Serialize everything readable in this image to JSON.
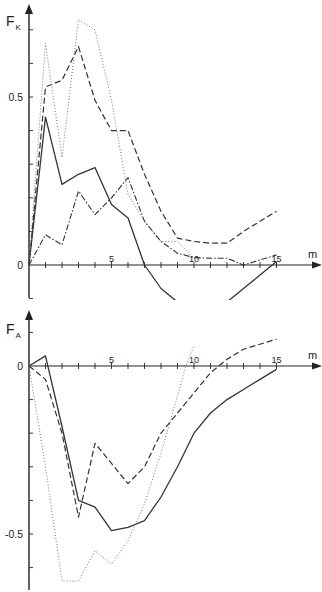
{
  "chart_data": [
    {
      "type": "line",
      "title": "",
      "ylabel": "F_K",
      "ylabel_main": "F",
      "ylabel_sub": "K",
      "xlabel": "m",
      "xlim": [
        0,
        17
      ],
      "ylim": [
        -0.2,
        0.75
      ],
      "x_ticks": [
        1,
        2,
        3,
        4,
        5,
        6,
        7,
        8,
        9,
        10,
        11,
        12,
        13,
        14,
        15
      ],
      "x_tick_labels": [
        {
          "value": 5,
          "label": "5"
        },
        {
          "value": 10,
          "label": "10"
        },
        {
          "value": 15,
          "label": "15"
        }
      ],
      "y_ticks": [
        -0.1,
        0.1,
        0.2,
        0.3,
        0.4,
        0.5,
        0.6,
        0.7
      ],
      "y_tick_labels": [
        {
          "value": 0,
          "label": "0"
        },
        {
          "value": 0.5,
          "label": "0.5"
        }
      ],
      "grid": false,
      "legend": "none",
      "series": [
        {
          "name": "solid",
          "style": "solid",
          "x": [
            0,
            1,
            2,
            3,
            4,
            5,
            6,
            7,
            8,
            9,
            10,
            11,
            12,
            13,
            14,
            15
          ],
          "y": [
            0,
            0.44,
            0.24,
            0.27,
            0.29,
            0.18,
            0.14,
            0.0,
            -0.07,
            -0.11,
            -0.125,
            -0.125,
            -0.11,
            -0.07,
            -0.03,
            0.01
          ]
        },
        {
          "name": "dashed",
          "style": "dashed",
          "x": [
            0,
            1,
            2,
            3,
            4,
            5,
            6,
            7,
            8,
            9,
            10,
            11,
            12,
            13,
            14,
            15
          ],
          "y": [
            0,
            0.53,
            0.55,
            0.65,
            0.49,
            0.4,
            0.4,
            0.27,
            0.16,
            0.08,
            0.07,
            0.065,
            0.065,
            0.1,
            0.13,
            0.16
          ]
        },
        {
          "name": "dotted",
          "style": "dotted",
          "x": [
            0,
            1,
            2,
            3,
            4,
            5,
            6,
            7,
            8,
            9,
            10
          ],
          "y": [
            0,
            0.66,
            0.32,
            0.73,
            0.7,
            0.49,
            0.21,
            0.13,
            0.07,
            0.07,
            0.02
          ]
        },
        {
          "name": "dash-dot",
          "style": "dashdot",
          "x": [
            0,
            1,
            2,
            3,
            4,
            5,
            6,
            7,
            8,
            9,
            10,
            11,
            12,
            13,
            14,
            15
          ],
          "y": [
            0,
            0.09,
            0.06,
            0.22,
            0.15,
            0.2,
            0.26,
            0.13,
            0.07,
            0.035,
            0.022,
            0.02,
            0.02,
            0.0,
            0.015,
            0.03
          ]
        }
      ]
    },
    {
      "type": "line",
      "title": "",
      "ylabel": "F_A",
      "ylabel_main": "F",
      "ylabel_sub": "A",
      "xlabel": "m",
      "xlim": [
        0,
        17
      ],
      "ylim": [
        -0.66,
        0.15
      ],
      "x_ticks": [
        1,
        2,
        3,
        4,
        5,
        6,
        7,
        8,
        9,
        10,
        11,
        12,
        13,
        14,
        15
      ],
      "x_tick_labels": [
        {
          "value": 5,
          "label": "5"
        },
        {
          "value": 10,
          "label": "10"
        },
        {
          "value": 15,
          "label": "15"
        }
      ],
      "y_ticks": [
        0.1,
        -0.1,
        -0.2,
        -0.3,
        -0.4,
        -0.5,
        -0.6
      ],
      "y_tick_labels": [
        {
          "value": 0,
          "label": "0"
        },
        {
          "value": -0.5,
          "label": "-0.5"
        }
      ],
      "grid": false,
      "legend": "none",
      "series": [
        {
          "name": "solid",
          "style": "solid",
          "x": [
            0,
            1,
            2,
            3,
            4,
            5,
            6,
            7,
            8,
            9,
            10,
            11,
            12,
            13,
            14,
            15
          ],
          "y": [
            0,
            0.03,
            -0.18,
            -0.4,
            -0.42,
            -0.49,
            -0.48,
            -0.46,
            -0.39,
            -0.3,
            -0.2,
            -0.14,
            -0.1,
            -0.07,
            -0.04,
            -0.01
          ]
        },
        {
          "name": "dashed",
          "style": "dashed",
          "x": [
            0,
            1,
            2,
            3,
            4,
            5,
            6,
            7,
            8,
            9,
            10,
            11,
            12,
            13,
            14,
            15
          ],
          "y": [
            0,
            -0.04,
            -0.2,
            -0.45,
            -0.23,
            -0.29,
            -0.35,
            -0.3,
            -0.2,
            -0.14,
            -0.08,
            -0.02,
            0.02,
            0.05,
            0.065,
            0.08
          ]
        },
        {
          "name": "dotted",
          "style": "dotted",
          "x": [
            0,
            1,
            2,
            3,
            4,
            5,
            6,
            7,
            8,
            9,
            9.5,
            10
          ],
          "y": [
            0,
            -0.3,
            -0.64,
            -0.64,
            -0.55,
            -0.59,
            -0.52,
            -0.41,
            -0.26,
            -0.09,
            0.0,
            0.06
          ]
        }
      ]
    }
  ]
}
